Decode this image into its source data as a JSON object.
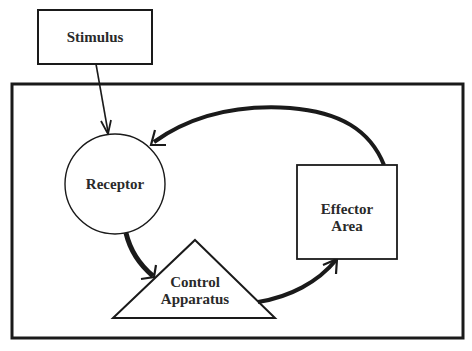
{
  "diagram": {
    "type": "control-loop-flow",
    "colors": {
      "stroke": "#1a1a1a",
      "text": "#2a2a2a",
      "background": "#ffffff"
    },
    "nodes": {
      "stimulus": {
        "label": "Stimulus",
        "shape": "rectangle"
      },
      "receptor": {
        "label": "Receptor",
        "shape": "circle"
      },
      "control": {
        "line1": "Control",
        "line2": "Apparatus",
        "shape": "triangle"
      },
      "effector": {
        "line1": "Effector",
        "line2": "Area",
        "shape": "rectangle"
      }
    },
    "system_boundary": {
      "shape": "rectangle",
      "encloses": [
        "receptor",
        "control",
        "effector"
      ]
    },
    "edges": [
      {
        "from": "stimulus",
        "to": "receptor",
        "style": "thin-arrow"
      },
      {
        "from": "receptor",
        "to": "control",
        "style": "thick-curved-arrow"
      },
      {
        "from": "control",
        "to": "effector",
        "style": "thick-curved-arrow"
      },
      {
        "from": "effector",
        "to": "receptor",
        "style": "thick-curved-arrow"
      }
    ]
  }
}
